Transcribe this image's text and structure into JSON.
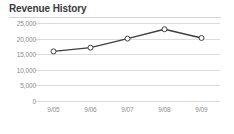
{
  "card": {
    "title": "Revenue History"
  },
  "chart_data": {
    "type": "line",
    "title": "Revenue History",
    "xlabel": "",
    "ylabel": "",
    "categories": [
      "9/05",
      "9/06",
      "9/07",
      "9/08",
      "9/09"
    ],
    "values": [
      15900,
      17100,
      20000,
      23000,
      20200
    ],
    "series": [
      {
        "name": "Revenue",
        "values": [
          15900,
          17100,
          20000,
          23000,
          20200
        ]
      }
    ],
    "ylim": [
      0,
      25000
    ],
    "yticks": [
      0,
      5000,
      10000,
      15000,
      20000,
      25000
    ],
    "ytick_labels": [
      "0",
      "5,000",
      "10,000",
      "15,000",
      "20,000",
      "25,000"
    ],
    "xtick_labels": [
      "9/05",
      "9/06",
      "9/07",
      "9/08",
      "9/09"
    ],
    "grid": true,
    "legend": false,
    "marker": "circle-open",
    "line_color": "#3f3f3f",
    "marker_fill": "#ffffff",
    "marker_stroke": "#3f3f3f",
    "grid_color": "#dcdcdc",
    "text_color": "#8a8a8a",
    "title_color": "#3a3a3a",
    "background": "#ffffff"
  }
}
